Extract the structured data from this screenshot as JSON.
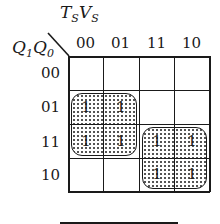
{
  "kmap": {
    "col_var": {
      "main1": "T",
      "sub1": "S",
      "main2": "V",
      "sub2": "S"
    },
    "row_var": {
      "main1": "Q",
      "sub1": "1",
      "main2": "Q",
      "sub2": "0"
    },
    "col_labels": [
      "00",
      "01",
      "11",
      "10"
    ],
    "row_labels": [
      "00",
      "01",
      "11",
      "10"
    ],
    "cells": [
      [
        "",
        "",
        "",
        ""
      ],
      [
        "1",
        "1",
        "",
        ""
      ],
      [
        "1",
        "1",
        "1",
        "1"
      ],
      [
        "",
        "",
        "1",
        "1"
      ]
    ],
    "groups": [
      {
        "rows": [
          1,
          2
        ],
        "cols": [
          0,
          1
        ]
      },
      {
        "rows": [
          2,
          3
        ],
        "cols": [
          2,
          3
        ]
      }
    ],
    "line_color": "#1a1a1a",
    "fill_pattern": "dotted"
  }
}
